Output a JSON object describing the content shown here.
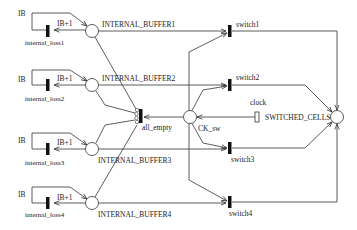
{
  "diagram": {
    "type": "petri-net",
    "places": {
      "buffer1": {
        "label": "INTERNAL_BUFFER1"
      },
      "buffer2": {
        "label": "INTERNAL_BUFFER2"
      },
      "buffer3": {
        "label": "INTERNAL_BUFFER3"
      },
      "buffer4": {
        "label": "INTERNAL_BUFFER4"
      },
      "ck_sw": {
        "label": "CK_sw"
      },
      "switched_cells": {
        "label": "SWITCHED_CELLS"
      }
    },
    "transitions": {
      "loss1": {
        "label": "internal_loss1"
      },
      "loss2": {
        "label": "internal_loss2"
      },
      "loss3": {
        "label": "internal_loss3"
      },
      "loss4": {
        "label": "internal_loss4"
      },
      "all_empty": {
        "label": "all_empty"
      },
      "clock": {
        "label": "clock"
      },
      "switch1": {
        "label": "switch1"
      },
      "switch2": {
        "label": "switch2"
      },
      "switch3": {
        "label": "switch3"
      },
      "switch4": {
        "label": "switch4"
      }
    },
    "arc_labels": {
      "ib": "IB",
      "ib_plus_1": "IB+1"
    }
  }
}
